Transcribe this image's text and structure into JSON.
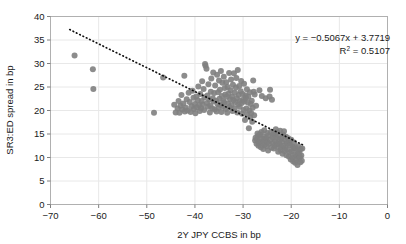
{
  "chart_data": {
    "type": "scatter",
    "title": "",
    "xlabel": "2Y JPY CCBS in bp",
    "ylabel": "SR3:ED spread in bp",
    "xlim": [
      -70,
      0
    ],
    "ylim": [
      0,
      40
    ],
    "xticks": [
      -70,
      -60,
      -50,
      -40,
      -30,
      -20,
      -10,
      0
    ],
    "xtick_labels": [
      "−70",
      "−60",
      "−50",
      "−40",
      "−30",
      "−20",
      "−10",
      "0"
    ],
    "yticks": [
      0,
      5,
      10,
      15,
      20,
      25,
      30,
      35,
      40
    ],
    "ytick_labels": [
      "0",
      "5",
      "10",
      "15",
      "20",
      "25",
      "30",
      "35",
      "40"
    ],
    "grid": true,
    "legend": null,
    "marker_color": "#7f7f7f",
    "marker_size": 4.2,
    "trendline": {
      "style": "dotted",
      "color": "#111111",
      "slope": -0.5067,
      "intercept": 3.7719,
      "x_start": -66.0,
      "x_end": -17.5
    },
    "annotations": [
      {
        "name": "equation",
        "text": "y = −0.5067x + 3.7719",
        "x": 390,
        "y": 41
      },
      {
        "name": "r-squared",
        "text_prefix": "R",
        "text_sup": "2",
        "text_suffix": " = 0.5107",
        "x": 390,
        "y": 54
      }
    ],
    "points": [
      [
        -65.0,
        31.7
      ],
      [
        -61.2,
        28.8
      ],
      [
        -61.1,
        24.6
      ],
      [
        -48.5,
        19.5
      ],
      [
        -46.6,
        27.0
      ],
      [
        -44.3,
        21.2
      ],
      [
        -44.0,
        19.6
      ],
      [
        -43.6,
        20.4
      ],
      [
        -43.4,
        22.0
      ],
      [
        -43.2,
        19.5
      ],
      [
        -43.0,
        21.0
      ],
      [
        -42.8,
        23.3
      ],
      [
        -42.6,
        20.2
      ],
      [
        -42.4,
        21.5
      ],
      [
        -42.2,
        27.4
      ],
      [
        -42.1,
        19.8
      ],
      [
        -41.9,
        20.6
      ],
      [
        -41.7,
        22.4
      ],
      [
        -41.5,
        20.0
      ],
      [
        -41.3,
        23.8
      ],
      [
        -41.1,
        21.8
      ],
      [
        -40.9,
        19.7
      ],
      [
        -40.7,
        20.9
      ],
      [
        -40.5,
        24.2
      ],
      [
        -40.3,
        22.7
      ],
      [
        -40.2,
        20.3
      ],
      [
        -40.0,
        21.4
      ],
      [
        -39.9,
        19.4
      ],
      [
        -39.7,
        23.0
      ],
      [
        -39.6,
        20.7
      ],
      [
        -39.4,
        22.2
      ],
      [
        -39.3,
        25.1
      ],
      [
        -39.1,
        21.1
      ],
      [
        -39.0,
        19.9
      ],
      [
        -38.9,
        23.5
      ],
      [
        -38.7,
        20.5
      ],
      [
        -38.6,
        22.0
      ],
      [
        -38.5,
        26.2
      ],
      [
        -38.4,
        21.3
      ],
      [
        -38.2,
        24.6
      ],
      [
        -38.1,
        20.1
      ],
      [
        -38.0,
        22.8
      ],
      [
        -37.9,
        29.9
      ],
      [
        -37.8,
        29.5
      ],
      [
        -37.6,
        28.9
      ],
      [
        -37.5,
        21.6
      ],
      [
        -37.4,
        23.2
      ],
      [
        -37.3,
        20.8
      ],
      [
        -37.2,
        25.6
      ],
      [
        -37.0,
        22.3
      ],
      [
        -36.9,
        19.6
      ],
      [
        -36.8,
        21.0
      ],
      [
        -36.7,
        24.0
      ],
      [
        -36.6,
        26.8
      ],
      [
        -36.4,
        20.4
      ],
      [
        -36.3,
        22.6
      ],
      [
        -36.2,
        28.1
      ],
      [
        -36.1,
        21.9
      ],
      [
        -36.0,
        23.7
      ],
      [
        -35.9,
        20.2
      ],
      [
        -35.8,
        25.3
      ],
      [
        -35.6,
        22.1
      ],
      [
        -35.5,
        19.8
      ],
      [
        -35.4,
        27.6
      ],
      [
        -35.3,
        21.4
      ],
      [
        -35.2,
        23.9
      ],
      [
        -35.1,
        20.6
      ],
      [
        -35.0,
        26.4
      ],
      [
        -34.9,
        22.5
      ],
      [
        -34.8,
        24.4
      ],
      [
        -34.7,
        21.2
      ],
      [
        -34.6,
        28.4
      ],
      [
        -34.5,
        19.7
      ],
      [
        -34.4,
        23.1
      ],
      [
        -34.3,
        25.9
      ],
      [
        -34.2,
        20.9
      ],
      [
        -34.1,
        22.0
      ],
      [
        -34.0,
        27.2
      ],
      [
        -33.9,
        21.7
      ],
      [
        -33.8,
        24.8
      ],
      [
        -33.7,
        23.4
      ],
      [
        -33.6,
        20.3
      ],
      [
        -33.5,
        26.0
      ],
      [
        -33.4,
        22.9
      ],
      [
        -33.3,
        19.5
      ],
      [
        -33.2,
        25.0
      ],
      [
        -33.1,
        21.5
      ],
      [
        -33.0,
        23.6
      ],
      [
        -32.9,
        28.0
      ],
      [
        -32.8,
        20.7
      ],
      [
        -32.7,
        22.4
      ],
      [
        -32.6,
        24.3
      ],
      [
        -32.5,
        26.6
      ],
      [
        -32.4,
        21.1
      ],
      [
        -32.3,
        23.0
      ],
      [
        -32.2,
        19.9
      ],
      [
        -32.1,
        25.5
      ],
      [
        -32.0,
        22.2
      ],
      [
        -31.9,
        27.9
      ],
      [
        -31.8,
        20.5
      ],
      [
        -31.7,
        23.8
      ],
      [
        -31.6,
        21.8
      ],
      [
        -31.5,
        24.9
      ],
      [
        -31.4,
        26.9
      ],
      [
        -31.3,
        22.6
      ],
      [
        -31.2,
        19.6
      ],
      [
        -31.1,
        28.6
      ],
      [
        -31.0,
        21.3
      ],
      [
        -30.9,
        23.3
      ],
      [
        -30.8,
        25.2
      ],
      [
        -30.7,
        20.8
      ],
      [
        -30.6,
        22.0
      ],
      [
        -30.5,
        24.1
      ],
      [
        -30.4,
        26.3
      ],
      [
        -30.3,
        21.6
      ],
      [
        -30.2,
        19.3
      ],
      [
        -30.1,
        23.5
      ],
      [
        -30.0,
        22.3
      ],
      [
        -29.9,
        20.1
      ],
      [
        -29.8,
        25.7
      ],
      [
        -29.7,
        21.9
      ],
      [
        -29.6,
        18.0
      ],
      [
        -29.5,
        23.2
      ],
      [
        -29.4,
        22.7
      ],
      [
        -29.3,
        20.4
      ],
      [
        -29.2,
        24.5
      ],
      [
        -29.1,
        19.2
      ],
      [
        -29.0,
        21.7
      ],
      [
        -28.9,
        22.9
      ],
      [
        -28.8,
        16.2
      ],
      [
        -28.7,
        20.0
      ],
      [
        -28.6,
        23.9
      ],
      [
        -28.5,
        18.5
      ],
      [
        -28.4,
        21.4
      ],
      [
        -28.3,
        19.4
      ],
      [
        -28.2,
        22.1
      ],
      [
        -28.1,
        17.6
      ],
      [
        -28.0,
        20.6
      ],
      [
        -27.9,
        26.4
      ],
      [
        -27.8,
        24.0
      ],
      [
        -27.7,
        19.0
      ],
      [
        -27.6,
        23.4
      ],
      [
        -27.5,
        13.6
      ],
      [
        -27.4,
        14.2
      ],
      [
        -27.3,
        21.0
      ],
      [
        -27.2,
        12.9
      ],
      [
        -27.1,
        13.9
      ],
      [
        -27.0,
        15.1
      ],
      [
        -26.9,
        14.6
      ],
      [
        -26.8,
        12.5
      ],
      [
        -26.7,
        13.2
      ],
      [
        -26.6,
        24.3
      ],
      [
        -26.5,
        14.9
      ],
      [
        -26.4,
        13.4
      ],
      [
        -26.3,
        12.2
      ],
      [
        -26.2,
        15.4
      ],
      [
        -26.1,
        23.1
      ],
      [
        -26.0,
        14.0
      ],
      [
        -25.9,
        13.0
      ],
      [
        -25.8,
        11.8
      ],
      [
        -25.7,
        14.4
      ],
      [
        -25.6,
        15.8
      ],
      [
        -25.5,
        12.7
      ],
      [
        -25.4,
        13.7
      ],
      [
        -25.3,
        22.6
      ],
      [
        -25.2,
        14.1
      ],
      [
        -25.1,
        12.4
      ],
      [
        -25.0,
        15.2
      ],
      [
        -24.9,
        13.3
      ],
      [
        -24.8,
        11.5
      ],
      [
        -24.7,
        14.7
      ],
      [
        -24.6,
        12.9
      ],
      [
        -24.5,
        23.0
      ],
      [
        -24.4,
        24.4
      ],
      [
        -24.3,
        13.8
      ],
      [
        -24.2,
        15.5
      ],
      [
        -24.1,
        12.1
      ],
      [
        -24.0,
        22.3
      ],
      [
        -23.9,
        14.3
      ],
      [
        -23.8,
        13.1
      ],
      [
        -23.7,
        15.0
      ],
      [
        -23.6,
        11.9
      ],
      [
        -23.5,
        14.8
      ],
      [
        -23.4,
        12.6
      ],
      [
        -23.3,
        13.5
      ],
      [
        -23.2,
        16.0
      ],
      [
        -23.1,
        14.2
      ],
      [
        -23.0,
        12.3
      ],
      [
        -22.9,
        15.3
      ],
      [
        -22.8,
        13.0
      ],
      [
        -22.7,
        11.2
      ],
      [
        -22.6,
        14.5
      ],
      [
        -22.5,
        12.8
      ],
      [
        -22.4,
        13.6
      ],
      [
        -22.3,
        15.7
      ],
      [
        -22.2,
        11.6
      ],
      [
        -22.1,
        14.0
      ],
      [
        -22.0,
        12.2
      ],
      [
        -21.9,
        13.3
      ],
      [
        -21.8,
        10.8
      ],
      [
        -21.7,
        14.9
      ],
      [
        -21.6,
        12.5
      ],
      [
        -21.5,
        15.6
      ],
      [
        -21.4,
        11.4
      ],
      [
        -21.3,
        13.9
      ],
      [
        -21.2,
        12.0
      ],
      [
        -21.1,
        14.4
      ],
      [
        -21.0,
        10.5
      ],
      [
        -20.9,
        13.1
      ],
      [
        -20.8,
        11.7
      ],
      [
        -20.7,
        12.9
      ],
      [
        -20.6,
        14.1
      ],
      [
        -20.5,
        10.2
      ],
      [
        -20.4,
        13.4
      ],
      [
        -20.3,
        11.1
      ],
      [
        -20.2,
        12.6
      ],
      [
        -20.1,
        9.6
      ],
      [
        -20.0,
        13.8
      ],
      [
        -19.9,
        11.3
      ],
      [
        -19.8,
        10.0
      ],
      [
        -19.7,
        12.3
      ],
      [
        -19.6,
        9.2
      ],
      [
        -19.5,
        11.9
      ],
      [
        -19.4,
        13.2
      ],
      [
        -19.3,
        10.6
      ],
      [
        -19.2,
        8.9
      ],
      [
        -19.1,
        12.1
      ],
      [
        -19.0,
        10.3
      ],
      [
        -18.9,
        9.5
      ],
      [
        -18.8,
        11.5
      ],
      [
        -18.7,
        8.4
      ],
      [
        -18.6,
        10.9
      ],
      [
        -18.5,
        12.4
      ],
      [
        -18.4,
        9.8
      ],
      [
        -18.3,
        11.0
      ],
      [
        -18.2,
        10.1
      ],
      [
        -18.1,
        9.0
      ],
      [
        -18.0,
        11.8
      ],
      [
        -17.9,
        10.4
      ],
      [
        -17.8,
        9.3
      ],
      [
        -17.7,
        11.9
      ]
    ]
  }
}
